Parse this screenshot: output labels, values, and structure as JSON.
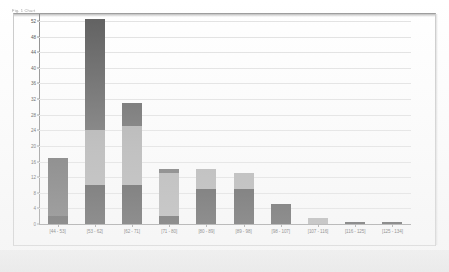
{
  "caption": {
    "text": "Fig. 1 Chart"
  },
  "chart_data": {
    "type": "bar",
    "subtype": "stacked-bar-histogram",
    "title": "",
    "subtitle": "",
    "xlabel": "",
    "ylabel": "",
    "grid": true,
    "legend_position": "none",
    "ylim": [
      0,
      52
    ],
    "ytick_step": 4,
    "yticks": [
      0,
      4,
      8,
      12,
      16,
      20,
      24,
      28,
      32,
      36,
      40,
      44,
      48,
      52
    ],
    "ytick_labels": [
      "0",
      "4",
      "8",
      "12",
      "16",
      "20",
      "24",
      "28",
      "32",
      "36",
      "40",
      "44",
      "48",
      "52"
    ],
    "categories": [
      "[44 - 53]",
      "[53 - 62]",
      "[62 - 71]",
      "[71 - 80]",
      "[80 - 89]",
      "[89 - 98]",
      "[98 - 107]",
      "[107 - 116]",
      "[116 - 125]",
      "[125 - 134]"
    ],
    "series": [
      {
        "name": "Series 1",
        "color": "#3a3a3a",
        "values": [
          2,
          10,
          10,
          2,
          9,
          9,
          5,
          0,
          0.6,
          0.6
        ]
      },
      {
        "name": "Series 2",
        "color": "#a8a8a8",
        "values": [
          0,
          14,
          15,
          11,
          5,
          4,
          0,
          1.5,
          0,
          0
        ]
      },
      {
        "name": "Series 3",
        "color": "#5c5c5c",
        "values": [
          15,
          28.5,
          6,
          1,
          0,
          0,
          0,
          0,
          0,
          0
        ]
      }
    ],
    "totals": [
      17,
      52.5,
      31,
      14,
      14,
      13,
      5,
      1.5,
      0.6,
      0.6
    ],
    "colors": {
      "series1": "#3a3a3a",
      "series2": "#a8a8a8",
      "series3": "#5c5c5c",
      "gridline": "#e2e2e2",
      "axis": "#8a8a8a",
      "background": "#ffffff"
    }
  }
}
